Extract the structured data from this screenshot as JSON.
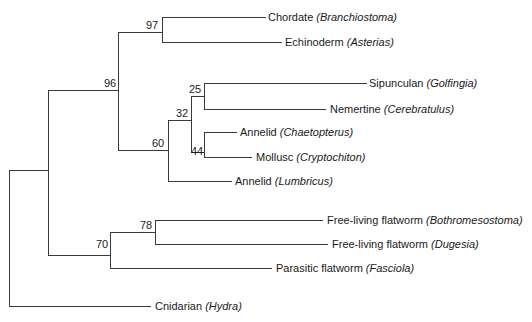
{
  "diagram": {
    "type": "phylogenetic-tree",
    "line_color": "#3a3a3a",
    "text_color": "#1a1a1a",
    "taxa": [
      {
        "group": "Chordate",
        "genus": "Branchiostoma",
        "y": 17,
        "x0": 162,
        "x1": 265,
        "tx": 268
      },
      {
        "group": "Echinoderm",
        "genus": "Asterias",
        "y": 42,
        "x0": 162,
        "x1": 281,
        "tx": 285
      },
      {
        "group": "Sipunculan",
        "genus": "Golfingia",
        "y": 83,
        "x0": 204,
        "x1": 366,
        "tx": 369
      },
      {
        "group": "Nemertine",
        "genus": "Cerebratulus",
        "y": 109,
        "x0": 204,
        "x1": 325,
        "tx": 330
      },
      {
        "group": "Annelid",
        "genus": "Chaetopterus",
        "y": 132,
        "x0": 204,
        "x1": 236,
        "tx": 240
      },
      {
        "group": "Mollusc",
        "genus": "Cryptochiton",
        "y": 157,
        "x0": 204,
        "x1": 251,
        "tx": 256
      },
      {
        "group": "Annelid",
        "genus": "Lumbricus",
        "y": 181,
        "x0": 168,
        "x1": 231,
        "tx": 235
      },
      {
        "group": "Free-living flatworm",
        "genus": "Bothromesostoma",
        "y": 220,
        "x0": 155,
        "x1": 322,
        "tx": 327
      },
      {
        "group": "Free-living flatworm",
        "genus": "Dugesia",
        "y": 244,
        "x0": 155,
        "x1": 327,
        "tx": 332
      },
      {
        "group": "Parasitic flatworm",
        "genus": "Fasciola",
        "y": 268,
        "x0": 110,
        "x1": 271,
        "tx": 276
      },
      {
        "group": "Cnidarian",
        "genus": "Hydra",
        "y": 306,
        "x0": 9,
        "x1": 150,
        "tx": 155
      }
    ],
    "internal_horizontals": [
      {
        "y": 170,
        "x0": 9,
        "x1": 48
      },
      {
        "y": 90,
        "x0": 48,
        "x1": 118
      },
      {
        "y": 255,
        "x0": 48,
        "x1": 110
      },
      {
        "y": 32,
        "x0": 118,
        "x1": 162
      },
      {
        "y": 150,
        "x0": 118,
        "x1": 168
      },
      {
        "y": 120,
        "x0": 168,
        "x1": 191
      },
      {
        "y": 96,
        "x0": 191,
        "x1": 204
      },
      {
        "y": 152,
        "x0": 191,
        "x1": 204
      },
      {
        "y": 232,
        "x0": 110,
        "x1": 155
      }
    ],
    "verticals": [
      {
        "x": 9,
        "y0": 170,
        "y1": 306
      },
      {
        "x": 48,
        "y0": 90,
        "y1": 255
      },
      {
        "x": 118,
        "y0": 32,
        "y1": 150
      },
      {
        "x": 162,
        "y0": 17,
        "y1": 42
      },
      {
        "x": 168,
        "y0": 120,
        "y1": 181
      },
      {
        "x": 191,
        "y0": 96,
        "y1": 152
      },
      {
        "x": 204,
        "y0": 83,
        "y1": 109
      },
      {
        "x": 204,
        "y0": 132,
        "y1": 157
      },
      {
        "x": 110,
        "y0": 232,
        "y1": 268
      },
      {
        "x": 155,
        "y0": 220,
        "y1": 244
      }
    ],
    "bootstrap": [
      {
        "value": "97",
        "x": 146,
        "y": 19
      },
      {
        "value": "96",
        "x": 104,
        "y": 77
      },
      {
        "value": "25",
        "x": 189,
        "y": 83
      },
      {
        "value": "32",
        "x": 176,
        "y": 107
      },
      {
        "value": "60",
        "x": 152,
        "y": 137
      },
      {
        "value": "44",
        "x": 191,
        "y": 145
      },
      {
        "value": "78",
        "x": 140,
        "y": 219
      },
      {
        "value": "70",
        "x": 96,
        "y": 238
      }
    ]
  }
}
